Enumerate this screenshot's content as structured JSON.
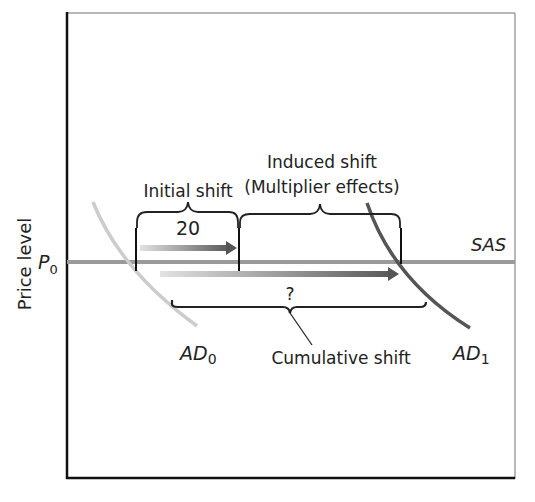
{
  "diagram": {
    "type": "aggregate-demand-multiplier",
    "y_axis_label": "Price level",
    "price_label": {
      "main": "P",
      "sub": "0"
    },
    "curves": {
      "sas": {
        "label": "SAS",
        "color": "#9a9a9a"
      },
      "ad0": {
        "label_main": "AD",
        "label_sub": "0",
        "color": "#c8c8c8"
      },
      "ad1": {
        "label_main": "AD",
        "label_sub": "1",
        "color": "#555555"
      }
    },
    "annotations": {
      "initial_shift": "Initial shift",
      "initial_shift_value": "20",
      "induced_shift_line1": "Induced shift",
      "induced_shift_line2": "(Multiplier effects)",
      "cumulative_value": "?",
      "cumulative_shift": "Cumulative shift"
    },
    "colors": {
      "axis": "#111111",
      "frame": "#999999",
      "arrow_start": "#dddddd",
      "arrow_end": "#555555",
      "brace": "#222222"
    }
  }
}
